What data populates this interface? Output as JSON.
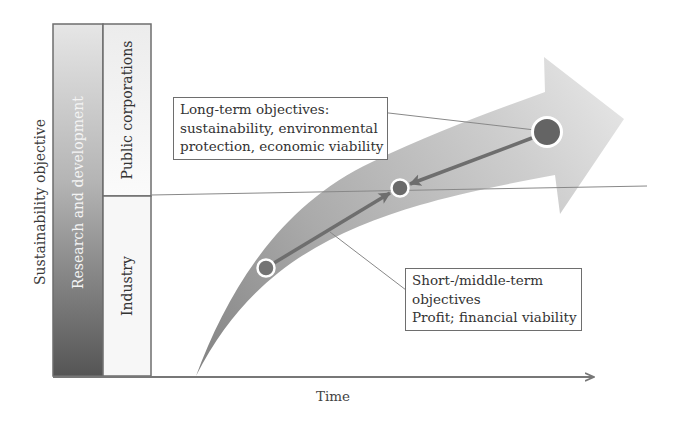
{
  "diagram": {
    "y_axis_label": "Sustainability objective",
    "x_axis_label": "Time",
    "columns": {
      "research": {
        "label": "Research and development"
      },
      "public": {
        "label": "Public corporations"
      },
      "industry": {
        "label": "Industry"
      }
    },
    "callouts": {
      "long_term": {
        "lines": [
          "Long-term objectives:",
          "sustainability, environmental",
          "protection, economic viability"
        ]
      },
      "short_term": {
        "lines": [
          "Short-/middle-term",
          "objectives",
          "Profit; financial viability"
        ]
      }
    },
    "points": [
      {
        "name": "industry-point",
        "cx": 266,
        "cy": 268,
        "r": 9
      },
      {
        "name": "meeting-point",
        "cx": 400,
        "cy": 188,
        "r": 9
      },
      {
        "name": "public-point",
        "cx": 547,
        "cy": 132,
        "r": 15
      }
    ],
    "colors": {
      "arrow_light": "#d8d8d8",
      "arrow_dark": "#8a8a8a",
      "point_fill": "#6a6a6a",
      "axis": "#777777",
      "rd_top": "#e3e3e3",
      "rd_bottom": "#5a5a5a",
      "column_fill": "#f2f2f2"
    }
  }
}
